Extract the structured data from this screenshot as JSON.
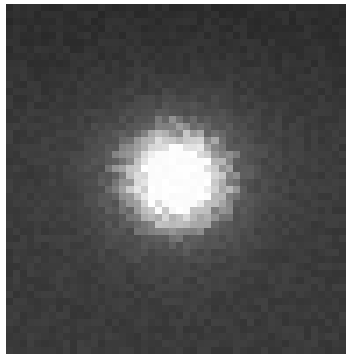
{
  "image": {
    "description": "Grayscale pixelated image of a single bright point source (saturated white core with gray halo) on a dark noisy background",
    "colormap": "grayscale",
    "background_color": "#3a3a3a",
    "background_top_color": "#2c2c2c",
    "core_color": "#ffffff",
    "grid_cells": [
      48,
      50
    ],
    "source": {
      "center_fraction": [
        0.5,
        0.5
      ],
      "core_radius_fraction": 0.1,
      "halo_radius_fraction": 0.2
    }
  }
}
